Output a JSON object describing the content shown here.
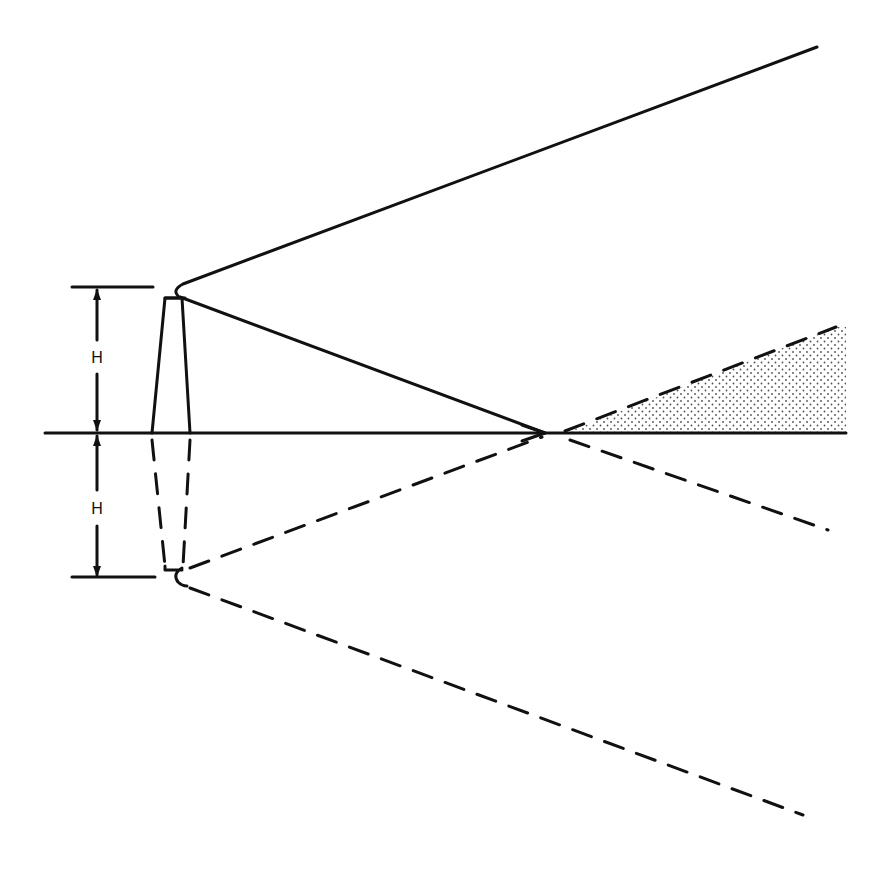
{
  "diagram": {
    "type": "antenna-ray-geometry",
    "labels": {
      "upper_height": "H",
      "lower_height": "H"
    },
    "colors": {
      "ink": "#111111",
      "background": "#ffffff",
      "shading_dot": "#333333"
    },
    "geometry": {
      "ground_line": {
        "x1": 45,
        "x2": 846,
        "y": 433
      },
      "antenna_top": {
        "x": 175,
        "y": 290
      },
      "image_antenna_bottom": {
        "x": 175,
        "y": 576
      },
      "reflection_point": {
        "x": 545,
        "y": 433
      },
      "direct_ray_end": {
        "x": 817,
        "y": 47
      },
      "image_ray_end": {
        "x": 803,
        "y": 815
      },
      "reflected_ray_end": {
        "x": 836,
        "y": 327
      },
      "below_ground_dash_end": {
        "x": 828,
        "y": 530
      },
      "dimension_x": 97,
      "dim_top_y": 287,
      "dim_bottom_y": 578
    }
  }
}
